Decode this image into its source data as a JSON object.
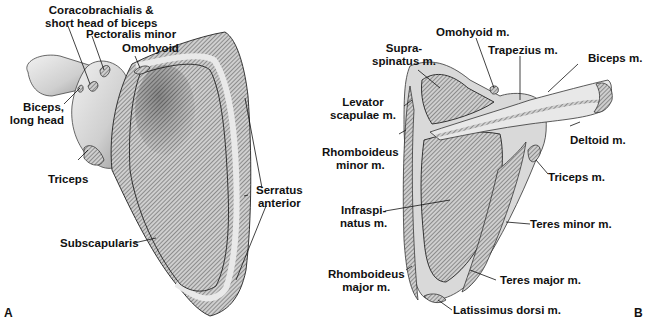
{
  "figure": {
    "panels": [
      {
        "letter": "A",
        "view": "anterior",
        "labels": {
          "coracobrachialis_line1": "Coracobrachialis &",
          "coracobrachialis_line2": "short head of biceps",
          "pectoralis_minor": "Pectoralis minor",
          "omohyoid": "Omohyoid",
          "biceps_line1": "Biceps,",
          "biceps_line2": "long head",
          "triceps": "Triceps",
          "serratus_line1": "Serratus",
          "serratus_line2": "anterior",
          "subscapularis": "Subscapularis"
        }
      },
      {
        "letter": "B",
        "view": "posterior",
        "labels": {
          "supraspinatus_line1": "Supra-",
          "supraspinatus_line2": "spinatus m.",
          "omohyoid": "Omohyoid m.",
          "trapezius": "Trapezius m.",
          "biceps": "Biceps m.",
          "levator_line1": "Levator",
          "levator_line2": "scapulae m.",
          "deltoid": "Deltoid m.",
          "rhomboid_minor_line1": "Rhomboideus",
          "rhomboid_minor_line2": "minor m.",
          "triceps": "Triceps m.",
          "infraspinatus_line1": "Infraspi-",
          "infraspinatus_line2": "natus m.",
          "teres_minor": "Teres minor m.",
          "rhomboid_major_line1": "Rhomboideus",
          "rhomboid_major_line2": "major m.",
          "teres_major": "Teres major m.",
          "latissimus": "Latissimus dorsi m."
        }
      }
    ],
    "colors": {
      "ink": "#111111",
      "bone_light": "#e6e6e6",
      "bone_mid": "#bdbdbd",
      "muscle_hatch": "#555555"
    }
  }
}
